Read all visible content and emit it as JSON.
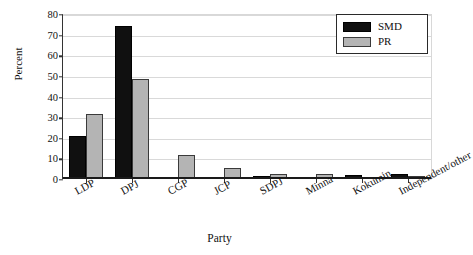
{
  "chart_data": {
    "type": "bar",
    "title": "",
    "xlabel": "Party",
    "ylabel": "Percent",
    "ylim": [
      0,
      80
    ],
    "yticks": [
      0,
      10,
      20,
      30,
      40,
      50,
      60,
      70,
      80
    ],
    "grid": true,
    "legend_position": "top-right",
    "categories": [
      "LDP",
      "DPJ",
      "CGP",
      "JCP",
      "SDPJ",
      "Minna",
      "Kokumin",
      "Independent/other"
    ],
    "series": [
      {
        "name": "SMD",
        "color": "#101010",
        "values": [
          21.0,
          74.1,
          0.0,
          0.0,
          1.5,
          1.2,
          1.9,
          2.5
        ]
      },
      {
        "name": "PR",
        "color": "#b4b4b4",
        "values": [
          31.4,
          48.7,
          11.8,
          5.5,
          2.3,
          2.3,
          0.0,
          1.6
        ]
      }
    ]
  },
  "axes": {
    "y_title": "Percent",
    "x_title": "Party",
    "y_tick_labels": [
      "0",
      "10",
      "20",
      "30",
      "40",
      "50",
      "60",
      "70",
      "80"
    ]
  },
  "legend": {
    "items": [
      {
        "label": "SMD",
        "swatch": "black-swatch"
      },
      {
        "label": "PR",
        "swatch": "gray-swatch"
      }
    ]
  }
}
